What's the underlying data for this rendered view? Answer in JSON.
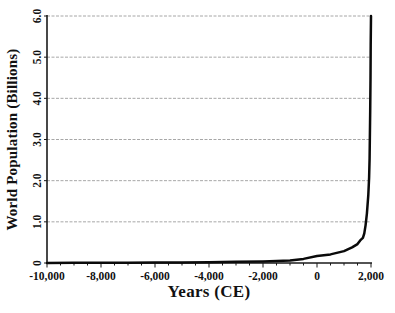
{
  "chart_data": {
    "type": "line",
    "title": "",
    "xlabel": "Years (CE)",
    "ylabel": "World Population (Billions)",
    "xlim": [
      -10000,
      2000
    ],
    "ylim": [
      0,
      6
    ],
    "grid": "horizontal-major",
    "legend": "none",
    "x_ticks": [
      {
        "value": -10000,
        "label": "-10,000"
      },
      {
        "value": -8000,
        "label": "-8,000"
      },
      {
        "value": -6000,
        "label": "-6,000"
      },
      {
        "value": -4000,
        "label": "-4,000"
      },
      {
        "value": -2000,
        "label": "-2,000"
      },
      {
        "value": 0,
        "label": "0"
      },
      {
        "value": 2000,
        "label": "2,000"
      }
    ],
    "x_minor_tick_step": 500,
    "y_ticks": [
      {
        "value": 0,
        "label": "0"
      },
      {
        "value": 1,
        "label": "1.0"
      },
      {
        "value": 2,
        "label": "2.0"
      },
      {
        "value": 3,
        "label": "3.0"
      },
      {
        "value": 4,
        "label": "4.0"
      },
      {
        "value": 5,
        "label": "5.0"
      },
      {
        "value": 6,
        "label": "6.0"
      }
    ],
    "colors": {
      "line": "#0a0a0a",
      "grid": "#9e9e9e",
      "axis": "#1a1a1a",
      "text": "#111111",
      "background": "#ffffff"
    },
    "series": [
      {
        "name": "World population",
        "points": [
          [
            -10000,
            0.002
          ],
          [
            -9000,
            0.004
          ],
          [
            -8000,
            0.006
          ],
          [
            -7000,
            0.008
          ],
          [
            -6000,
            0.011
          ],
          [
            -5000,
            0.015
          ],
          [
            -4000,
            0.02
          ],
          [
            -3000,
            0.03
          ],
          [
            -2000,
            0.04
          ],
          [
            -1000,
            0.06
          ],
          [
            -500,
            0.1
          ],
          [
            0,
            0.17
          ],
          [
            500,
            0.21
          ],
          [
            1000,
            0.29
          ],
          [
            1300,
            0.38
          ],
          [
            1500,
            0.46
          ],
          [
            1600,
            0.55
          ],
          [
            1700,
            0.61
          ],
          [
            1750,
            0.72
          ],
          [
            1800,
            0.92
          ],
          [
            1850,
            1.2
          ],
          [
            1900,
            1.65
          ],
          [
            1930,
            2.07
          ],
          [
            1950,
            2.54
          ],
          [
            1970,
            3.7
          ],
          [
            1980,
            4.45
          ],
          [
            1990,
            5.3
          ],
          [
            2000,
            6.0
          ]
        ]
      }
    ]
  }
}
